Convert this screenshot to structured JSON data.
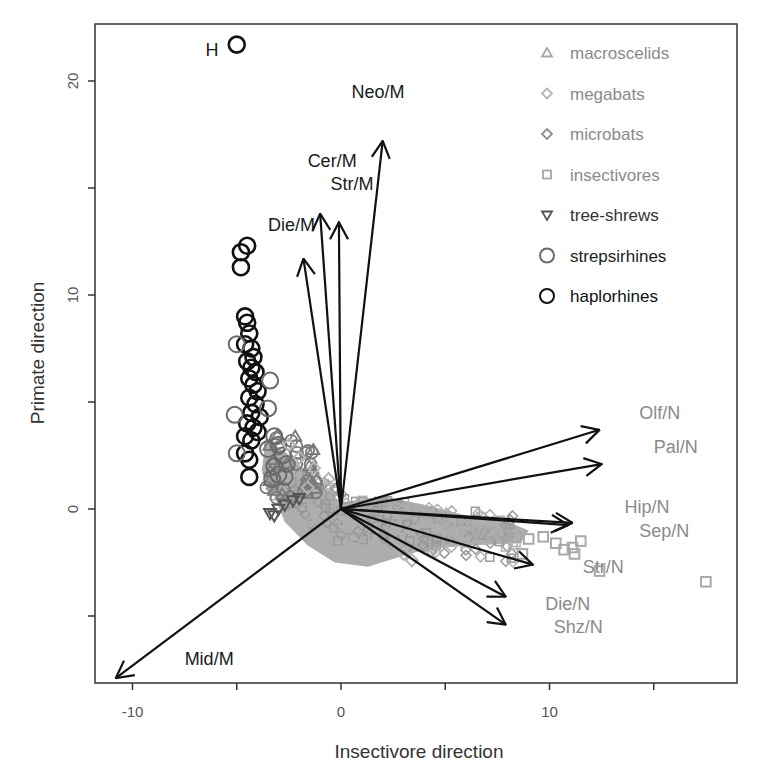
{
  "chart_data": {
    "type": "scatter",
    "title": "",
    "xlabel": "Insectivore direction",
    "ylabel": "Primate direction",
    "xlim": [
      -11.5,
      19
    ],
    "ylim": [
      -8.2,
      22.6
    ],
    "x_ticks": [
      -10,
      -5,
      0,
      5,
      10,
      15
    ],
    "x_tick_labels": [
      "-10",
      "",
      "0",
      "",
      "10",
      ""
    ],
    "y_ticks": [
      -5,
      0,
      5,
      10,
      15,
      20
    ],
    "y_tick_labels": [
      "",
      "0",
      "",
      "10",
      "",
      "20"
    ],
    "grid": false,
    "legend_position": "top-right",
    "legend": [
      {
        "label": "macroscelids",
        "marker": "triangle-up",
        "color": "#a8a8a8"
      },
      {
        "label": "megabats",
        "marker": "diamond",
        "color": "#b4b4b4"
      },
      {
        "label": "microbats",
        "marker": "diamond",
        "color": "#8e8e8e"
      },
      {
        "label": "insectivores",
        "marker": "square",
        "color": "#a8a8a8"
      },
      {
        "label": "tree-shrews",
        "marker": "triangle-down",
        "color": "#555555"
      },
      {
        "label": "strepsirhines",
        "marker": "circle",
        "color": "#6a6a6a"
      },
      {
        "label": "haplorhines",
        "marker": "circle",
        "color": "#111111"
      }
    ],
    "annotations": [
      {
        "text": "H",
        "x": -6.5,
        "y": 21.5
      }
    ],
    "arrows": [
      {
        "label": "Neo/M",
        "x": 2.0,
        "y": 17.2,
        "group": "M",
        "label_x": 0.5,
        "label_y": 19.2
      },
      {
        "label": "Cer/M",
        "x": -1.0,
        "y": 13.8,
        "group": "M",
        "label_x": -1.6,
        "label_y": 16.0
      },
      {
        "label": "Str/M",
        "x": -0.1,
        "y": 13.4,
        "group": "M",
        "label_x": -0.5,
        "label_y": 14.9
      },
      {
        "label": "Die/M",
        "x": -1.8,
        "y": 11.7,
        "group": "M",
        "label_x": -3.5,
        "label_y": 13.0
      },
      {
        "label": "Mid/M",
        "x": -10.8,
        "y": -7.9,
        "group": "M",
        "label_x": -7.5,
        "label_y": -7.3
      },
      {
        "label": "Olf/N",
        "x": 12.4,
        "y": 3.7,
        "group": "N",
        "label_x": 14.3,
        "label_y": 4.2
      },
      {
        "label": "Pal/N",
        "x": 12.5,
        "y": 2.1,
        "group": "N",
        "label_x": 15.0,
        "label_y": 2.6
      },
      {
        "label": "Hip/N",
        "x": 11.1,
        "y": -0.65,
        "group": "N",
        "label_x": 13.6,
        "label_y": -0.2
      },
      {
        "label": "Sep/N",
        "x": 10.9,
        "y": -0.75,
        "group": "N",
        "label_x": 14.3,
        "label_y": -1.3
      },
      {
        "label": "Str/N",
        "x": 9.2,
        "y": -2.6,
        "group": "N",
        "label_x": 11.6,
        "label_y": -3.0
      },
      {
        "label": "Die/N",
        "x": 7.9,
        "y": -4.1,
        "group": "N",
        "label_x": 9.8,
        "label_y": -4.7
      },
      {
        "label": "Shz/N",
        "x": 7.9,
        "y": -5.4,
        "group": "N",
        "label_x": 10.2,
        "label_y": -5.8
      }
    ],
    "series": [
      {
        "name": "haplorhines",
        "marker": "circle",
        "points": [
          [
            -5.0,
            21.7
          ],
          [
            -4.5,
            12.3
          ],
          [
            -4.8,
            12.0
          ],
          [
            -4.8,
            11.3
          ],
          [
            -4.6,
            9.0
          ],
          [
            -4.5,
            8.7
          ],
          [
            -4.4,
            8.2
          ],
          [
            -4.6,
            7.7
          ],
          [
            -4.3,
            7.5
          ],
          [
            -4.2,
            7.1
          ],
          [
            -4.5,
            6.9
          ],
          [
            -4.3,
            6.6
          ],
          [
            -4.1,
            6.4
          ],
          [
            -4.4,
            6.1
          ],
          [
            -4.2,
            5.8
          ],
          [
            -4.0,
            5.5
          ],
          [
            -4.4,
            5.2
          ],
          [
            -4.1,
            4.9
          ],
          [
            -4.3,
            4.5
          ],
          [
            -3.9,
            4.3
          ],
          [
            -4.5,
            4.0
          ],
          [
            -4.2,
            3.8
          ],
          [
            -4.0,
            3.6
          ],
          [
            -4.6,
            3.4
          ],
          [
            -4.3,
            3.2
          ],
          [
            -4.6,
            2.6
          ],
          [
            -4.4,
            2.3
          ],
          [
            -4.4,
            1.5
          ]
        ]
      },
      {
        "name": "strepsirhines",
        "marker": "circle",
        "points": [
          [
            -5.0,
            7.7
          ],
          [
            -5.1,
            4.4
          ],
          [
            -5.0,
            2.6
          ],
          [
            -3.4,
            6.0
          ],
          [
            -3.5,
            4.7
          ],
          [
            -3.2,
            3.4
          ],
          [
            -3.5,
            2.8
          ],
          [
            -3.0,
            3.0
          ],
          [
            -2.8,
            2.5
          ],
          [
            -3.2,
            2.0
          ],
          [
            -3.0,
            1.6
          ],
          [
            -2.6,
            2.1
          ],
          [
            -2.7,
            1.5
          ],
          [
            -3.3,
            1.4
          ]
        ]
      },
      {
        "name": "tree-shrews",
        "marker": "triangle-down",
        "points": [
          [
            -3.4,
            -0.2
          ],
          [
            -3.0,
            0.0
          ],
          [
            -2.7,
            0.2
          ],
          [
            -2.3,
            0.4
          ],
          [
            -2.0,
            0.5
          ],
          [
            -3.2,
            -0.3
          ]
        ]
      },
      {
        "name": "megabats",
        "marker": "diamond",
        "points": [
          [
            -2.5,
            3.0
          ],
          [
            -2.0,
            2.4
          ],
          [
            -1.3,
            1.9
          ],
          [
            -0.6,
            1.4
          ],
          [
            -1.6,
            1.0
          ],
          [
            2.4,
            -1.7
          ],
          [
            3.0,
            -2.1
          ],
          [
            3.4,
            -2.4
          ]
        ]
      },
      {
        "name": "insectivores",
        "marker": "square",
        "points": [
          [
            1.0,
            0.3
          ],
          [
            1.6,
            0.2
          ],
          [
            2.4,
            0.1
          ],
          [
            3.2,
            0.0
          ],
          [
            4.0,
            -0.2
          ],
          [
            4.8,
            -0.4
          ],
          [
            5.4,
            -0.6
          ],
          [
            6.0,
            -0.8
          ],
          [
            6.6,
            -1.0
          ],
          [
            7.2,
            -1.1
          ],
          [
            7.8,
            -1.2
          ],
          [
            8.4,
            -1.3
          ],
          [
            9.0,
            -1.4
          ],
          [
            8.7,
            -2.1
          ],
          [
            9.7,
            -1.3
          ],
          [
            10.3,
            -1.6
          ],
          [
            10.7,
            -1.9
          ],
          [
            11.1,
            -1.8
          ],
          [
            11.5,
            -1.5
          ],
          [
            11.2,
            -2.1
          ],
          [
            12.4,
            -2.9
          ],
          [
            17.5,
            -3.4
          ]
        ]
      },
      {
        "name": "microbats",
        "marker": "diamond",
        "cluster": "dense region around origin, roughly x -4..8, y -2.5..2.5"
      },
      {
        "name": "macroscelids",
        "marker": "triangle-up",
        "cluster": "overlapping dense gray region near origin"
      }
    ]
  },
  "ui": {
    "x_axis_title": "Insectivore direction",
    "y_axis_title": "Primate direction"
  }
}
